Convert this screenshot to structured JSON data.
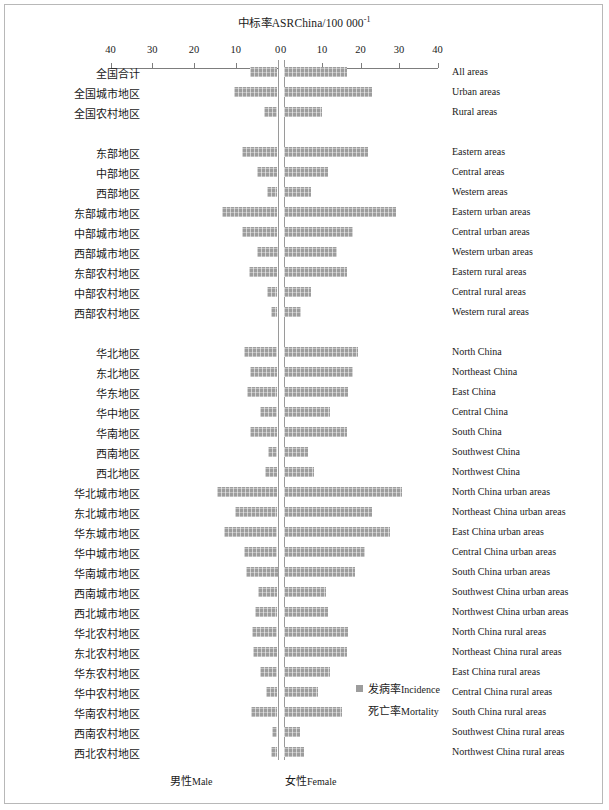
{
  "chart": {
    "title_cn": "中标率ASR",
    "title_en": "China/100 000",
    "title_sup": "-1",
    "title_full": "中标率ASR China/100 000⁻¹"
  },
  "axis": {
    "left_ticks": [
      "40",
      "30",
      "20",
      "10",
      "0"
    ],
    "right_ticks": [
      "0",
      "10",
      "20",
      "30",
      "40"
    ],
    "max": 40,
    "left_label_cn": "男性",
    "left_label_en": "Male",
    "right_label_cn": "女性",
    "right_label_en": "Female"
  },
  "legend": {
    "items": [
      {
        "cn": "发病率",
        "en": "Incidence",
        "color": "#9d9d9d",
        "swatch": true
      },
      {
        "cn": "死亡率",
        "en": "Mortality",
        "color": "#9d9d9d",
        "swatch": false
      }
    ]
  },
  "chart_data": {
    "type": "bar",
    "orientation": "horizontal-diverging",
    "xlabel": "ASR China per 100 000",
    "ylabel": "",
    "xlim": [
      -40,
      40
    ],
    "grid": false,
    "legend_position": "inside-bottom-right",
    "series": [
      {
        "name": "男性Male",
        "side": "left"
      },
      {
        "name": "女性Female",
        "side": "right"
      }
    ],
    "categories_cn": [
      "全国合计",
      "全国城市地区",
      "全国农村地区",
      "东部地区",
      "中部地区",
      "西部地区",
      "东部城市地区",
      "中部城市地区",
      "西部城市地区",
      "东部农村地区",
      "中部农村地区",
      "西部农村地区",
      "华北地区",
      "东北地区",
      "华东地区",
      "华中地区",
      "华南地区",
      "西南地区",
      "西北地区",
      "华北城市地区",
      "东北城市地区",
      "华东城市地区",
      "华中城市地区",
      "华南城市地区",
      "西南城市地区",
      "西北城市地区",
      "华北农村地区",
      "东北农村地区",
      "华东农村地区",
      "华中农村地区",
      "华南农村地区",
      "西南农村地区",
      "西北农村地区"
    ],
    "categories_en": [
      "All areas",
      "Urban areas",
      "Rural areas",
      "Eastern areas",
      "Central areas",
      "Western areas",
      "Eastern urban areas",
      "Central urban areas",
      "Western urban areas",
      "Eastern rural areas",
      "Central rural areas",
      "Western rural areas",
      "North China",
      "Northeast China",
      "East China",
      "Central China",
      "South China",
      "Southwest China",
      "Northwest China",
      "North China urban areas",
      "Northeast China urban areas",
      "East China urban areas",
      "Central China urban areas",
      "South China urban areas",
      "Southwest China urban areas",
      "Northwest China urban areas",
      "North China rural areas",
      "Northeast China rural areas",
      "East China rural areas",
      "Central China rural areas",
      "South China rural areas",
      "Southwest China rural areas",
      "Northwest China rural areas"
    ],
    "male": [
      6.6,
      10.5,
      3.3,
      8.5,
      4.8,
      2.6,
      13.2,
      8.4,
      5.0,
      6.9,
      2.4,
      1.6,
      8.1,
      6.6,
      7.2,
      4.2,
      6.6,
      2.3,
      3.0,
      14.4,
      10.1,
      12.7,
      8.0,
      7.5,
      4.7,
      5.5,
      6.2,
      5.8,
      4.3,
      2.8,
      6.4,
      1.4,
      1.5
    ],
    "female": [
      16.5,
      22.9,
      10.0,
      21.9,
      11.5,
      7.1,
      29.2,
      18.1,
      13.8,
      16.4,
      7.1,
      4.5,
      19.4,
      18.1,
      16.8,
      12.0,
      16.5,
      6.3,
      7.8,
      30.7,
      23.1,
      27.6,
      21.1,
      18.7,
      11.0,
      11.6,
      16.8,
      16.6,
      12.0,
      9.0,
      15.2,
      4.3,
      5.2
    ],
    "row_gap_after": [
      2,
      11
    ]
  }
}
